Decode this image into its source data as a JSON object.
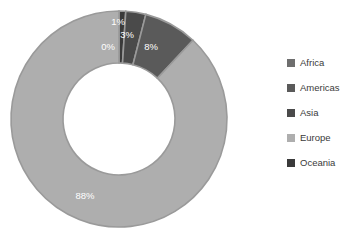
{
  "chart_data": {
    "type": "pie",
    "variant": "donut",
    "title": "",
    "subtitle": "",
    "xlabel": "",
    "ylabel": "",
    "categories": [
      "Africa",
      "Americas",
      "Asia",
      "Europe",
      "Oceania"
    ],
    "values": [
      0,
      8,
      3,
      88,
      1
    ],
    "unit": "%",
    "data_labels": [
      "0%",
      "8%",
      "3%",
      "88%",
      "1%"
    ],
    "slice_order_clockwise_from_top": [
      "Oceania",
      "Asia",
      "Americas",
      "Europe",
      "Africa"
    ],
    "colors": {
      "Africa": "#6e6e6e",
      "Americas": "#5a5a5a",
      "Asia": "#4a4a4a",
      "Europe": "#aeaeae",
      "Oceania": "#3a3a3a"
    },
    "slice_stroke_color": "#9a9a9a",
    "data_label_color": "#ffffff",
    "legend": {
      "position": "right",
      "entries": [
        {
          "label": "Africa",
          "color": "#6e6e6e"
        },
        {
          "label": "Americas",
          "color": "#5a5a5a"
        },
        {
          "label": "Asia",
          "color": "#4a4a4a"
        },
        {
          "label": "Europe",
          "color": "#aeaeae"
        },
        {
          "label": "Oceania",
          "color": "#3a3a3a"
        }
      ]
    },
    "grid": false,
    "background": "#ffffff",
    "geometry": {
      "center_x": 119,
      "center_y": 119,
      "outer_radius": 108,
      "inner_radius": 56
    },
    "slices": [
      {
        "name": "Oceania",
        "percent": 1,
        "label": "1%",
        "color": "#3a3a3a",
        "start_deg": 0,
        "end_deg": 3.6,
        "label_x": 118,
        "label_y": 22
      },
      {
        "name": "Asia",
        "percent": 3,
        "label": "3%",
        "color": "#4a4a4a",
        "start_deg": 3.6,
        "end_deg": 14.4,
        "label_x": 127,
        "label_y": 35
      },
      {
        "name": "Americas",
        "percent": 8,
        "label": "8%",
        "color": "#5a5a5a",
        "start_deg": 14.4,
        "end_deg": 43.2,
        "label_x": 151,
        "label_y": 47
      },
      {
        "name": "Europe",
        "percent": 88,
        "label": "88%",
        "color": "#aeaeae",
        "start_deg": 43.2,
        "end_deg": 360,
        "label_x": 85,
        "label_y": 196
      },
      {
        "name": "Africa",
        "percent": 0,
        "label": "0%",
        "color": "#6e6e6e",
        "start_deg": 360,
        "end_deg": 360,
        "label_x": 108,
        "label_y": 47
      }
    ]
  }
}
